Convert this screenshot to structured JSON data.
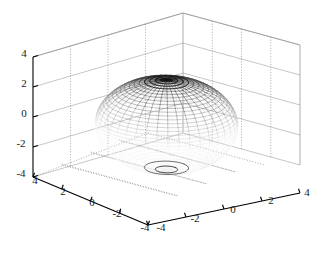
{
  "figure": {
    "background_color": "#ffffff",
    "axis_color": "#000000",
    "grid_color": "#9a9a9a",
    "mesh_color": "#1a1a1a",
    "width": 325,
    "height": 260
  },
  "chart_data": {
    "type": "line",
    "plot_kind": "3d-mesh-surface",
    "title": "",
    "subtitle": "",
    "xlabel": "",
    "ylabel": "",
    "zlabel": "",
    "grid": true,
    "legend": null,
    "legend_position": "none",
    "surface": {
      "name": "unit sphere (radius 3)",
      "equation": "x^2 + y^2 + z^2 = 9",
      "center": [
        0,
        0,
        0
      ],
      "radius": 3,
      "mesh_rows": 40,
      "mesh_cols": 40,
      "shading": "top-pole dark fading to white near equator, dark rim at bottom pole",
      "render": "wireframe mesh"
    },
    "axes": {
      "x": {
        "label": "",
        "lim": [
          -4,
          4
        ],
        "ticks": [
          -4,
          -2,
          0,
          2,
          4
        ],
        "ticklabels": [
          "-4",
          "-2",
          "0",
          "2",
          "4"
        ]
      },
      "y": {
        "label": "",
        "lim": [
          -4,
          4
        ],
        "ticks": [
          4,
          2,
          0,
          -2,
          -4
        ],
        "ticklabels": [
          "4",
          "2",
          "0",
          "-2",
          "-4"
        ]
      },
      "z": {
        "label": "",
        "lim": [
          -4,
          4
        ],
        "ticks": [
          4,
          2,
          0,
          -2,
          -4
        ],
        "ticklabels": [
          "4",
          "2",
          "0",
          "-2",
          "-4"
        ]
      }
    },
    "view": {
      "azimuth_deg": -37.5,
      "elevation_deg": 30
    },
    "annotations": []
  },
  "ticks": {
    "z": [
      {
        "value": "4",
        "px": 24,
        "py": 57
      },
      {
        "value": "2",
        "px": 24,
        "py": 87
      },
      {
        "value": "0",
        "px": 24,
        "py": 117
      },
      {
        "value": "-2",
        "px": 21,
        "py": 147
      },
      {
        "value": "-4",
        "px": 21,
        "py": 177
      }
    ],
    "y": [
      {
        "value": "4",
        "px": 35,
        "py": 184
      },
      {
        "value": "2",
        "px": 63,
        "py": 195
      },
      {
        "value": "0",
        "px": 92,
        "py": 206
      },
      {
        "value": "-2",
        "px": 117,
        "py": 217
      },
      {
        "value": "-4",
        "px": 145,
        "py": 231
      }
    ],
    "x": [
      {
        "value": "-4",
        "px": 161,
        "py": 231
      },
      {
        "value": "-2",
        "px": 195,
        "py": 222
      },
      {
        "value": "0",
        "px": 233,
        "py": 213
      },
      {
        "value": "2",
        "px": 271,
        "py": 204
      },
      {
        "value": "4",
        "px": 307,
        "py": 196
      }
    ]
  }
}
